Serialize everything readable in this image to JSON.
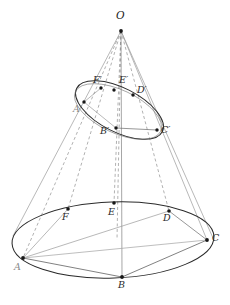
{
  "figure": {
    "type": "geometry-diagram",
    "background_color": "#ffffff",
    "line_color_outline": "#2b2b2b",
    "line_color_ruling": "#9a9a9a",
    "line_color_hidden": "#8f8f8f",
    "point_color": "#171717",
    "label_color": "#2a2a2a",
    "width": 230,
    "height": 305
  },
  "apex": {
    "name": "O",
    "label": "O",
    "x": 121,
    "y": 31,
    "label_x": 116,
    "label_y": 12
  },
  "base_ellipse": {
    "cx": 113,
    "cy": 240,
    "rx": 101,
    "ry": 38,
    "rotation": -2
  },
  "section_ellipse": {
    "cx": 119.5,
    "cy": 110,
    "rx": 48,
    "ry": 22,
    "rotation": 27
  },
  "base_points": [
    {
      "name": "A",
      "label": "A",
      "x": 23,
      "y": 258,
      "label_x": 14,
      "label_y": 264,
      "faint": true
    },
    {
      "name": "B",
      "label": "B",
      "x": 122,
      "y": 277,
      "label_x": 118,
      "label_y": 281,
      "faint": false
    },
    {
      "name": "C",
      "label": "C",
      "x": 207,
      "y": 240,
      "label_x": 212,
      "label_y": 235,
      "faint": false
    },
    {
      "name": "D",
      "label": "D",
      "x": 169,
      "y": 211,
      "label_x": 163,
      "label_y": 214,
      "faint": false
    },
    {
      "name": "E",
      "label": "E",
      "x": 114,
      "y": 203,
      "label_x": 108,
      "label_y": 208,
      "faint": false
    },
    {
      "name": "F",
      "label": "F",
      "x": 68,
      "y": 209,
      "label_x": 62,
      "label_y": 213,
      "faint": false
    }
  ],
  "section_points": [
    {
      "name": "A-prime",
      "label": "A′",
      "x": 84,
      "y": 102,
      "label_x": 74,
      "label_y": 105,
      "faint": true
    },
    {
      "name": "B-prime",
      "label": "B′",
      "x": 116,
      "y": 128,
      "label_x": 101,
      "label_y": 127,
      "faint": false
    },
    {
      "name": "C-prime",
      "label": "C′",
      "x": 157,
      "y": 130,
      "label_x": 161,
      "label_y": 126,
      "faint": false
    },
    {
      "name": "D-prime",
      "label": "D′",
      "x": 133,
      "y": 95,
      "label_x": 137,
      "label_y": 86,
      "faint": false
    },
    {
      "name": "E-prime",
      "label": "E′",
      "x": 114,
      "y": 90,
      "label_x": 119,
      "label_y": 76,
      "faint": false
    },
    {
      "name": "F-prime",
      "label": "F′",
      "x": 101,
      "y": 88,
      "label_x": 93,
      "label_y": 76,
      "faint": false
    }
  ],
  "rulings": [
    {
      "name": "O-A",
      "from": "apex",
      "to": "A",
      "style": "dashed"
    },
    {
      "name": "O-B",
      "from": "apex",
      "to": "B",
      "style": "solid"
    },
    {
      "name": "O-C",
      "from": "apex",
      "to": "C",
      "style": "solid"
    },
    {
      "name": "O-D",
      "from": "apex",
      "to": "D",
      "style": "dashed"
    },
    {
      "name": "O-E",
      "from": "apex",
      "to": "E",
      "style": "dashed"
    },
    {
      "name": "O-F",
      "from": "apex",
      "to": "F",
      "style": "dashed"
    }
  ],
  "chords": [
    {
      "name": "chord-A-B",
      "from": "A",
      "to": "B"
    },
    {
      "name": "chord-B-C",
      "from": "B",
      "to": "C"
    },
    {
      "name": "chord-A-C",
      "from": "A",
      "to": "C"
    },
    {
      "name": "chord-A-D",
      "from": "A",
      "to": "D"
    },
    {
      "name": "chord-A-F",
      "from": "A",
      "to": "F"
    },
    {
      "name": "chord-C-D",
      "from": "C",
      "to": "D"
    },
    {
      "name": "chord-B-prime-C-prime",
      "from": "B-prime",
      "to": "C-prime"
    },
    {
      "name": "chord-A-prime-B-prime",
      "from": "A-prime",
      "to": "B-prime"
    },
    {
      "name": "chord-A-prime-F-prime",
      "from": "A-prime",
      "to": "F-prime"
    }
  ]
}
